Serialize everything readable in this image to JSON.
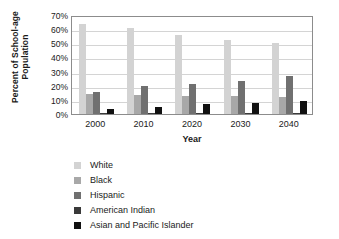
{
  "chart_data": {
    "type": "bar",
    "title": "",
    "xlabel": "Year",
    "ylabel": "Percent of School-age Population",
    "ylabel_lines": [
      "Percent of School-age",
      "Population"
    ],
    "categories": [
      "2000",
      "2010",
      "2020",
      "2030",
      "2040"
    ],
    "ylim": [
      0,
      70
    ],
    "ytick_labels": [
      "0%",
      "10%",
      "20%",
      "30%",
      "40%",
      "50%",
      "60%",
      "70%"
    ],
    "ytick_values": [
      0,
      10,
      20,
      30,
      40,
      50,
      60,
      70
    ],
    "grid": "horizontal",
    "legend_position": "below-left",
    "series": [
      {
        "name": "White",
        "color": "#d3d3d3",
        "values": [
          64,
          60.5,
          56,
          52,
          50.5
        ]
      },
      {
        "name": "Black",
        "color": "#a8a8a8",
        "values": [
          14.5,
          13.5,
          13,
          12.5,
          12
        ]
      },
      {
        "name": "Hispanic",
        "color": "#707070",
        "values": [
          15.5,
          20,
          21.5,
          23.5,
          27
        ]
      },
      {
        "name": "American Indian",
        "color": "#3a3a3a",
        "values": [
          1,
          1,
          1,
          1,
          1
        ]
      },
      {
        "name": "Asian and Pacific Islander",
        "color": "#111111",
        "values": [
          3.5,
          5,
          7,
          8,
          9
        ]
      }
    ]
  },
  "legend": {
    "items": [
      {
        "label": "White",
        "color": "#d3d3d3"
      },
      {
        "label": "Black",
        "color": "#a8a8a8"
      },
      {
        "label": "Hispanic",
        "color": "#707070"
      },
      {
        "label": "American Indian",
        "color": "#3a3a3a"
      },
      {
        "label": "Asian and Pacific Islander",
        "color": "#111111"
      }
    ]
  },
  "colors": {
    "frame": "#8c8c8c",
    "gridline": "#d4d4d4",
    "text": "#1a1a1a",
    "background": "#ffffff"
  }
}
